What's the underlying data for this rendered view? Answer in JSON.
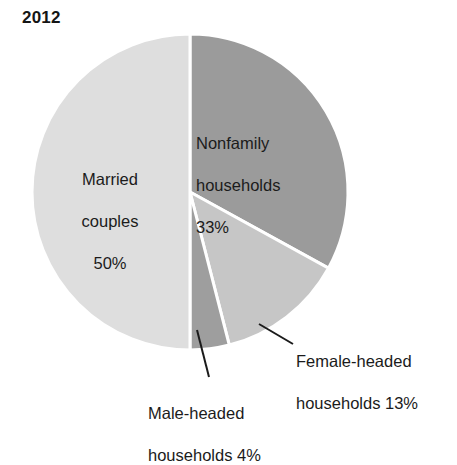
{
  "chart_data": {
    "type": "pie",
    "title": "2012",
    "xlabel": "",
    "ylabel": "",
    "legend_position": "none",
    "grid": false,
    "units": "percent",
    "start_angle_deg": 0,
    "direction": "clockwise",
    "categories": [
      "Nonfamily households",
      "Female-headed households",
      "Male-headed households",
      "Married couples"
    ],
    "values": [
      33,
      13,
      4,
      50
    ],
    "slices": [
      {
        "name": "Nonfamily households",
        "label_line1": "Nonfamily",
        "label_line2": "households",
        "label_line3": "33%",
        "value": 33,
        "value_text": "33%",
        "color": "#9b9b9b",
        "label_placement": "inside",
        "leader_line": false
      },
      {
        "name": "Female-headed households",
        "label_line1": "Female-headed",
        "label_line2": "households 13%",
        "value": 13,
        "value_text": "13%",
        "color": "#c6c6c6",
        "label_placement": "outside",
        "leader_line": true
      },
      {
        "name": "Male-headed households",
        "label_line1": "Male-headed",
        "label_line2": "households 4%",
        "value": 4,
        "value_text": "4%",
        "color": "#9e9e9e",
        "label_placement": "outside",
        "leader_line": true
      },
      {
        "name": "Married couples",
        "label_line1": "Married",
        "label_line2": "couples",
        "label_line3": "50%",
        "value": 50,
        "value_text": "50%",
        "color": "#dedede",
        "label_placement": "inside",
        "leader_line": false
      }
    ],
    "background_color": "#ffffff",
    "text_color": "#1b1b1b",
    "separator_color": "#ffffff"
  }
}
